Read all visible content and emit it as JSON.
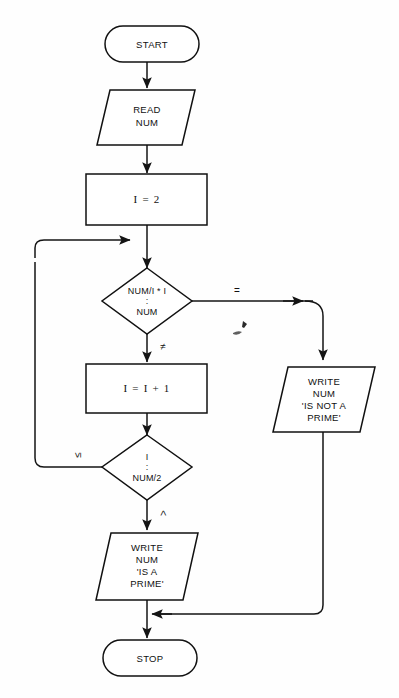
{
  "diagram": {
    "type": "flowchart",
    "background_color": "#fefefe",
    "line_color": "#111111",
    "shape_fill": "#ffffff",
    "nodes": [
      {
        "id": "start",
        "shape": "terminator-oval",
        "label": "START",
        "lines": [
          "START"
        ]
      },
      {
        "id": "read-num",
        "shape": "parallelogram-io",
        "label": "READ NUM",
        "lines": [
          "READ",
          "NUM"
        ]
      },
      {
        "id": "init-i",
        "shape": "rectangle-process",
        "label": "I = 2",
        "lines": [
          "I = 2"
        ]
      },
      {
        "id": "compare-num-div",
        "shape": "diamond-decision",
        "label": "NUM/I * I : NUM",
        "lines": [
          "NUM/I * I",
          ":",
          "NUM"
        ]
      },
      {
        "id": "increment-i",
        "shape": "rectangle-process",
        "label": "I = I + 1",
        "lines": [
          "I = I + 1"
        ]
      },
      {
        "id": "compare-i-half",
        "shape": "diamond-decision",
        "label": "I : NUM/2",
        "lines": [
          "I",
          ":",
          "NUM/2"
        ]
      },
      {
        "id": "write-not-prime",
        "shape": "parallelogram-io",
        "label": "WRITE NUM 'IS NOT A PRIME'",
        "lines": [
          "WRITE",
          "NUM",
          "'IS NOT A",
          "PRIME'"
        ]
      },
      {
        "id": "write-is-prime",
        "shape": "parallelogram-io",
        "label": "WRITE NUM 'IS A PRIME'",
        "lines": [
          "WRITE",
          "NUM",
          "'IS A",
          "PRIME'"
        ]
      },
      {
        "id": "stop",
        "shape": "terminator-oval",
        "label": "STOP",
        "lines": [
          "STOP"
        ]
      }
    ],
    "branch_labels": {
      "equal": "=",
      "not_equal": "≠",
      "less_or_equal": "≤",
      "greater": ">"
    },
    "edges": [
      {
        "id": "start-to-read",
        "from": "start",
        "to": "read-num",
        "label": ""
      },
      {
        "id": "read-to-init",
        "from": "read-num",
        "to": "init-i",
        "label": ""
      },
      {
        "id": "init-to-decision",
        "from": "init-i",
        "to": "compare-num-div",
        "label": ""
      },
      {
        "id": "decision-equal-branch",
        "from": "compare-num-div",
        "to": "write-not-prime",
        "label": "="
      },
      {
        "id": "decision-notequal-branch",
        "from": "compare-num-div",
        "to": "increment-i",
        "label": "≠"
      },
      {
        "id": "increment-to-loopcheck",
        "from": "increment-i",
        "to": "compare-i-half",
        "label": ""
      },
      {
        "id": "loopcheck-le-branch",
        "from": "compare-i-half",
        "to": "compare-num-div",
        "label": "≤"
      },
      {
        "id": "loopcheck-gt-branch",
        "from": "compare-i-half",
        "to": "write-is-prime",
        "label": ">"
      },
      {
        "id": "isprime-to-stop",
        "from": "write-is-prime",
        "to": "stop",
        "label": ""
      },
      {
        "id": "notprime-to-stop",
        "from": "write-not-prime",
        "to": "stop",
        "label": ""
      }
    ]
  }
}
